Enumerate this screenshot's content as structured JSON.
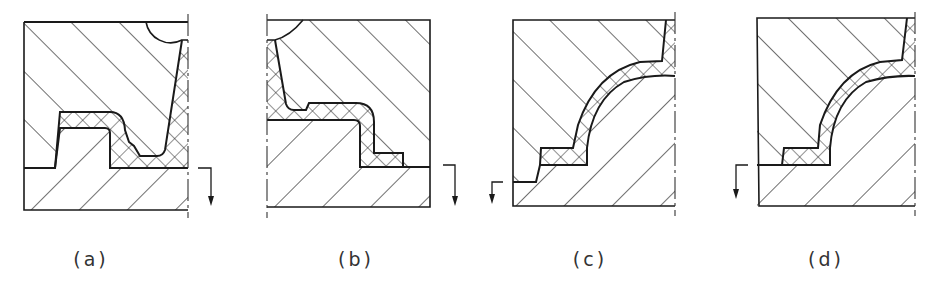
{
  "figure": {
    "panels": [
      {
        "id": "a",
        "label": "(a)",
        "label_x": 91
      },
      {
        "id": "b",
        "label": "(b)",
        "label_x": 356
      },
      {
        "id": "c",
        "label": "(c)",
        "label_x": 590
      },
      {
        "id": "d",
        "label": "(d)",
        "label_x": 826
      }
    ],
    "colors": {
      "line": "#1a1a1a",
      "background": "#ffffff"
    },
    "hatch_legend": {
      "single_hatch": "die / tool section",
      "cross_hatch": "workpiece (forging) section"
    }
  }
}
